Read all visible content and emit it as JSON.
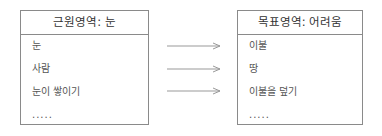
{
  "source_domain": {
    "title": "근원영역: 눈",
    "items": [
      "눈",
      "사람",
      "눈이 쌓이기",
      "....."
    ]
  },
  "target_domain": {
    "title": "목표영역: 어려움",
    "items": [
      "이불",
      "땅",
      "이불을 덮기",
      "....."
    ]
  },
  "mappings": [
    {
      "from": "눈",
      "to": "이불"
    },
    {
      "from": "사람",
      "to": "땅"
    },
    {
      "from": "눈이 쌓이기",
      "to": "이불을 덮기"
    }
  ]
}
